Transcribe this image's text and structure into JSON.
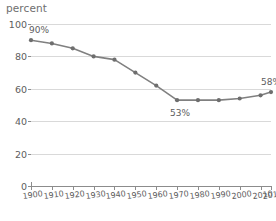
{
  "chart_data": {
    "type": "line",
    "title": "",
    "ylabel": "percent",
    "xlabel": "",
    "ylim": [
      0,
      100
    ],
    "yticks": [
      0,
      20,
      40,
      60,
      80,
      100
    ],
    "grid": true,
    "legend": "none",
    "xlim": [
      1900,
      2015
    ],
    "categories": [
      "1900",
      "1910",
      "1920",
      "1930",
      "1940",
      "1950",
      "1960",
      "1970",
      "1980",
      "1990",
      "2000",
      "2010",
      "2015"
    ],
    "x": [
      1900,
      1910,
      1920,
      1930,
      1940,
      1950,
      1960,
      1970,
      1980,
      1990,
      2000,
      2010,
      2015
    ],
    "values": [
      90,
      88,
      85,
      80,
      78,
      70,
      62,
      53,
      53,
      53,
      54,
      56,
      58
    ],
    "series": [
      {
        "name": "percent",
        "values": [
          90,
          88,
          85,
          80,
          78,
          70,
          62,
          53,
          53,
          53,
          54,
          56,
          58
        ]
      }
    ],
    "annotations": [
      {
        "label": "90%",
        "x": 1900,
        "y": 90
      },
      {
        "label": "53%",
        "x": 1970,
        "y": 53
      },
      {
        "label": "58%",
        "x": 2015,
        "y": 58
      }
    ]
  },
  "style": {
    "line_color": "#808080",
    "marker_color": "#6e6e6e",
    "grid_color": "#d9d9d9",
    "axis_color": "#8c8c8c",
    "text_color": "#5d5d5d",
    "background": "#ffffff"
  }
}
